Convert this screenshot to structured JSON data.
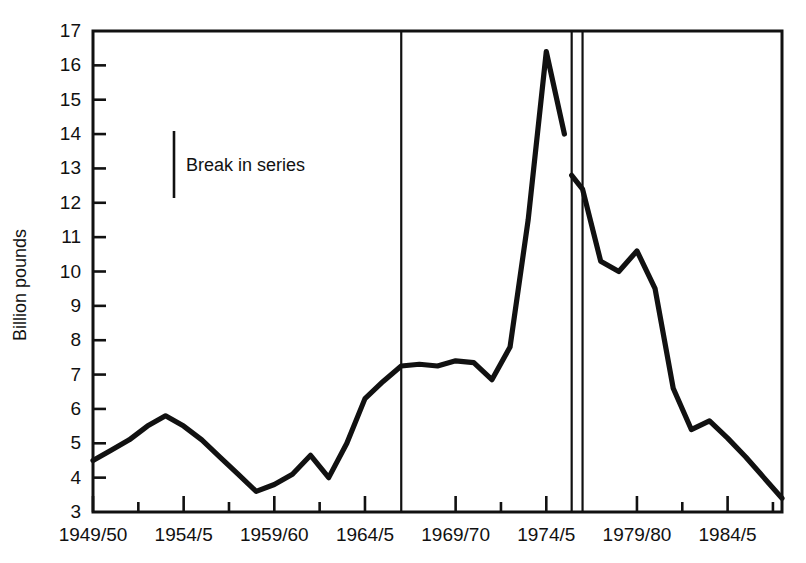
{
  "chart_data": {
    "type": "line",
    "title": "",
    "subtitle": "",
    "xlabel": "",
    "ylabel": "Billion pounds",
    "ylim": [
      3,
      17
    ],
    "ytick_labels": [
      "17",
      "16",
      "15",
      "14",
      "13",
      "12",
      "11",
      "10",
      "9",
      "8",
      "7",
      "6",
      "5",
      "4",
      "3"
    ],
    "ytick_values": [
      17,
      16,
      15,
      14,
      13,
      12,
      11,
      10,
      9,
      8,
      7,
      6,
      5,
      4,
      3
    ],
    "xtick_labels": [
      "1949/50",
      "1954/5",
      "1959/60",
      "1964/5",
      "1969/70",
      "1974/5",
      "1979/80",
      "1984/5"
    ],
    "xtick_values": [
      1949,
      1954,
      1959,
      1964,
      1969,
      1974,
      1979,
      1984
    ],
    "xlim": [
      1949,
      1987
    ],
    "grid": false,
    "legend_position": "inside-upper-left",
    "line_color": "#111111",
    "frame_color": "#111111",
    "annotations": [
      {
        "name": "break-in-series",
        "label": "Break in series",
        "marker": "vertical-rule"
      }
    ],
    "break_years": [
      1966,
      1975.4,
      1976
    ],
    "x": [
      1949,
      1950,
      1951,
      1952,
      1953,
      1954,
      1955,
      1956,
      1957,
      1958,
      1959,
      1960,
      1961,
      1962,
      1963,
      1964,
      1965,
      1966,
      1967,
      1968,
      1969,
      1970,
      1971,
      1972,
      1973,
      1974,
      1975,
      1975.4,
      1976,
      1977,
      1978,
      1979,
      1980,
      1981,
      1982,
      1983,
      1984,
      1985,
      1986,
      1987
    ],
    "values": [
      4.5,
      4.8,
      5.1,
      5.5,
      5.8,
      5.5,
      5.1,
      4.6,
      4.1,
      3.6,
      3.8,
      4.1,
      4.65,
      4.0,
      5.0,
      6.3,
      6.8,
      7.25,
      7.3,
      7.25,
      7.4,
      7.35,
      6.85,
      7.8,
      11.5,
      16.4,
      14.0,
      12.8,
      12.4,
      10.3,
      10.0,
      10.6,
      9.5,
      6.6,
      5.4,
      5.65,
      5.15,
      4.6,
      4.0,
      3.4
    ],
    "segments": [
      {
        "name": "segment-1949-1975",
        "x": [
          1949,
          1950,
          1951,
          1952,
          1953,
          1954,
          1955,
          1956,
          1957,
          1958,
          1959,
          1960,
          1961,
          1962,
          1963,
          1964,
          1965,
          1966,
          1967,
          1968,
          1969,
          1970,
          1971,
          1972,
          1973,
          1974,
          1975
        ],
        "values": [
          4.5,
          4.8,
          5.1,
          5.5,
          5.8,
          5.5,
          5.1,
          4.6,
          4.1,
          3.6,
          3.8,
          4.1,
          4.65,
          4.0,
          5.0,
          6.3,
          6.8,
          7.25,
          7.3,
          7.25,
          7.4,
          7.35,
          6.85,
          7.8,
          11.5,
          16.4,
          14.0
        ]
      },
      {
        "name": "segment-1976-1987",
        "x": [
          1975.4,
          1976,
          1977,
          1978,
          1979,
          1980,
          1981,
          1982,
          1983,
          1984,
          1985,
          1986,
          1987
        ],
        "values": [
          12.8,
          12.4,
          10.3,
          10.0,
          10.6,
          9.5,
          6.6,
          5.4,
          5.65,
          5.15,
          4.6,
          4.0,
          3.4
        ]
      }
    ]
  }
}
